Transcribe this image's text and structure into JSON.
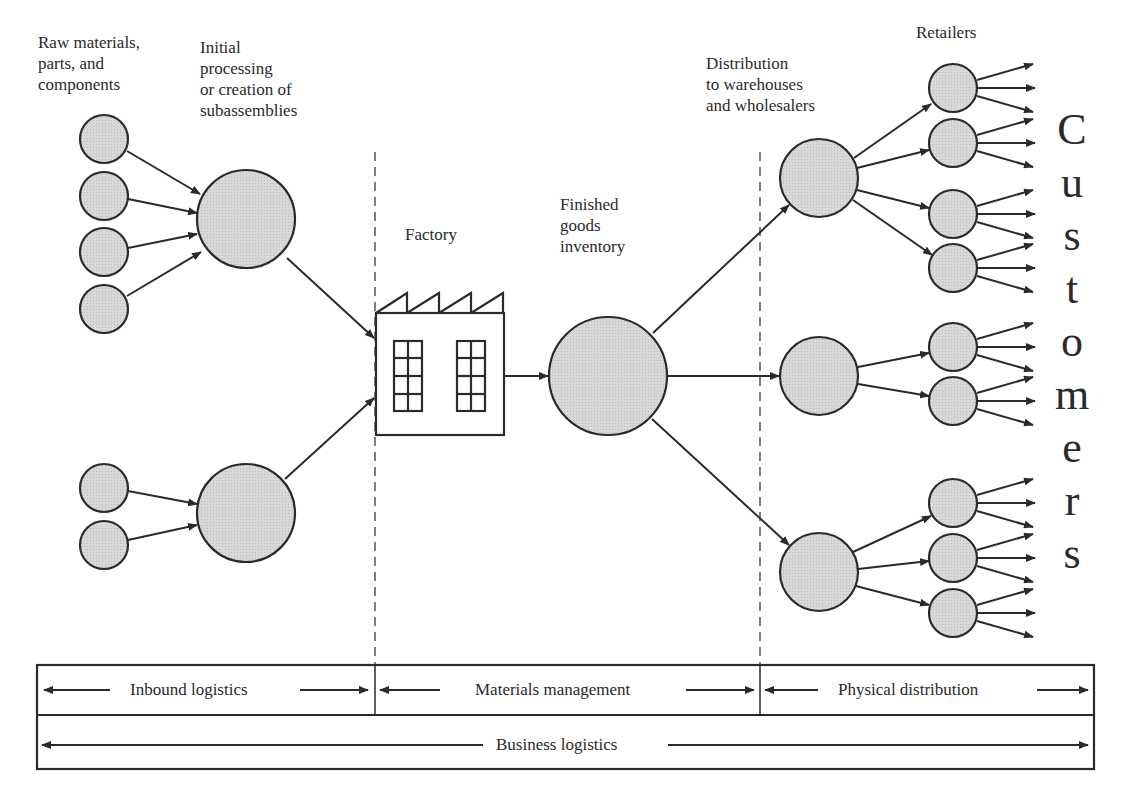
{
  "labels": {
    "raw_materials": "Raw materials,\nparts, and\ncomponents",
    "initial_processing": "Initial\nprocessing\nor creation of\nsubassemblies",
    "factory": "Factory",
    "finished_goods": "Finished\ngoods\ninventory",
    "distribution": "Distribution\nto warehouses\nand wholesalers",
    "retailers": "Retailers",
    "customers": [
      "C",
      "u",
      "s",
      "t",
      "o",
      "m",
      "e",
      "r",
      "s"
    ]
  },
  "bands": {
    "inbound": "Inbound logistics",
    "materials": "Materials management",
    "physical": "Physical distribution",
    "business": "Business logistics"
  },
  "colors": {
    "node_fill": "#d6d6d6",
    "stroke": "#2a2a2a",
    "background": "#ffffff"
  }
}
